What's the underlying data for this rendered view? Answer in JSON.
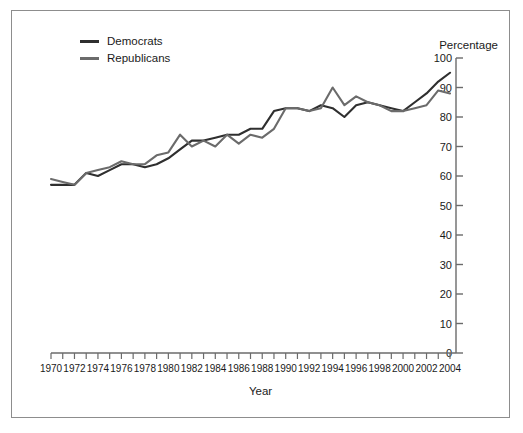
{
  "figure": {
    "border_color": "#8d8d8d",
    "background": "#ffffff"
  },
  "legend": {
    "position": "top-left",
    "entries": [
      {
        "label": "Democrats",
        "color": "#2f2f2f"
      },
      {
        "label": "Republicans",
        "color": "#6b6b6b"
      }
    ]
  },
  "axis_titles": {
    "y": "Percentage",
    "x": "Year"
  },
  "chart_data": {
    "type": "line",
    "title": "",
    "xlabel": "Year",
    "ylabel": "Percentage",
    "xlim": [
      1970,
      2004
    ],
    "ylim": [
      0,
      100
    ],
    "grid": false,
    "legend_position": "top-left",
    "y_ticks": [
      0,
      10,
      20,
      30,
      40,
      50,
      60,
      70,
      80,
      90,
      100
    ],
    "y_tick_labels": [
      "0",
      "10",
      "20",
      "30",
      "40",
      "50",
      "60",
      "70",
      "80",
      "90",
      "100"
    ],
    "x_ticks": [
      1970,
      1971,
      1972,
      1973,
      1974,
      1975,
      1976,
      1977,
      1978,
      1979,
      1980,
      1981,
      1982,
      1983,
      1984,
      1985,
      1986,
      1987,
      1988,
      1989,
      1990,
      1991,
      1992,
      1993,
      1994,
      1995,
      1996,
      1997,
      1998,
      1999,
      2000,
      2001,
      2002,
      2003,
      2004
    ],
    "x_tick_labels": [
      "1970",
      "1972",
      "1974",
      "1976",
      "1978",
      "1980",
      "1982",
      "1984",
      "1986",
      "1988",
      "1990",
      "1992",
      "1994",
      "1996",
      "1998",
      "2000",
      "2002",
      "2004"
    ],
    "x_label_step": 2,
    "x": [
      1970,
      1971,
      1972,
      1973,
      1974,
      1975,
      1976,
      1977,
      1978,
      1979,
      1980,
      1981,
      1982,
      1983,
      1984,
      1985,
      1986,
      1987,
      1988,
      1989,
      1990,
      1991,
      1992,
      1993,
      1994,
      1995,
      1996,
      1997,
      1998,
      1999,
      2000,
      2001,
      2002,
      2003,
      2004
    ],
    "series": [
      {
        "name": "Democrats",
        "color": "#2f2f2f",
        "values": [
          57,
          57,
          57,
          61,
          60,
          62,
          64,
          64,
          63,
          64,
          66,
          69,
          72,
          72,
          73,
          74,
          74,
          76,
          76,
          82,
          83,
          83,
          82,
          84,
          83,
          80,
          84,
          85,
          84,
          83,
          82,
          85,
          88,
          92,
          95
        ]
      },
      {
        "name": "Republicans",
        "color": "#6b6b6b",
        "values": [
          59,
          58,
          57,
          61,
          62,
          63,
          65,
          64,
          64,
          67,
          68,
          74,
          70,
          72,
          70,
          74,
          71,
          74,
          73,
          76,
          83,
          83,
          82,
          83,
          90,
          84,
          87,
          85,
          84,
          82,
          82,
          83,
          84,
          89,
          88
        ]
      }
    ]
  }
}
